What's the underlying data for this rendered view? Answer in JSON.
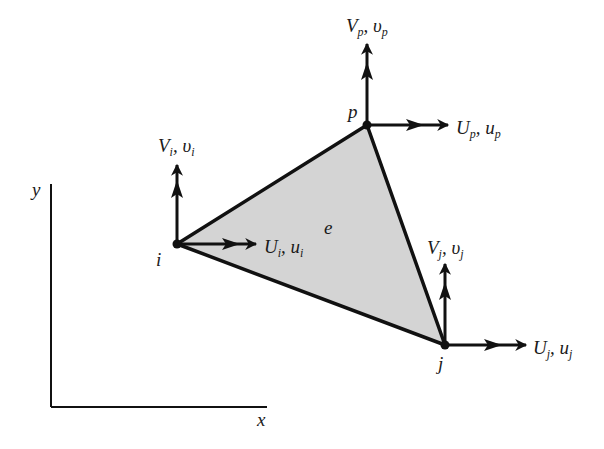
{
  "diagram": {
    "axes": {
      "x_label": "x",
      "y_label": "y"
    },
    "element_label": "e",
    "colors": {
      "fill": "#d4d4d4",
      "stroke": "#111111",
      "background": "#ffffff"
    },
    "nodes": [
      {
        "id": "i",
        "label": "i",
        "x": 177,
        "y": 244,
        "horizontal": {
          "main": "U",
          "sub": "i",
          "main2": "u",
          "sub2": "i"
        },
        "vertical": {
          "main": "V",
          "sub": "i",
          "main2": "υ",
          "sub2": "i"
        }
      },
      {
        "id": "j",
        "label": "j",
        "x": 445,
        "y": 345,
        "horizontal": {
          "main": "U",
          "sub": "j",
          "main2": "u",
          "sub2": "j"
        },
        "vertical": {
          "main": "V",
          "sub": "j",
          "main2": "υ",
          "sub2": "j"
        }
      },
      {
        "id": "p",
        "label": "p",
        "x": 367,
        "y": 125,
        "horizontal": {
          "main": "U",
          "sub": "p",
          "main2": "u",
          "sub2": "p"
        },
        "vertical": {
          "main": "V",
          "sub": "p",
          "main2": "υ",
          "sub2": "p"
        }
      }
    ]
  }
}
